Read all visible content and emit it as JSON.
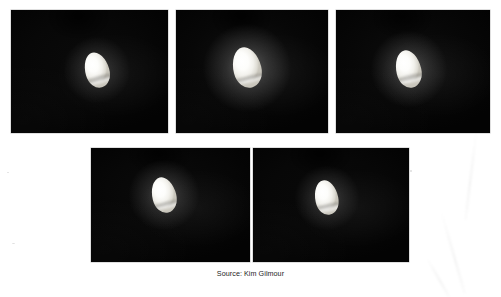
{
  "page": {
    "background_color": "#ffffff",
    "width": 501,
    "height": 295,
    "kind": "scanned-photo-plate"
  },
  "caption": {
    "text": "Source: Kim Gilmour",
    "color": "#1d1d1d",
    "x": 0,
    "y": 269,
    "align": "center"
  },
  "panels": [
    {
      "id": "photo-1",
      "label": "photo-panel-1",
      "row": "top",
      "index": 1,
      "x": 11,
      "y": 10,
      "width": 157,
      "height": 123,
      "background_color": "#050505",
      "sky_tint": "#0a0a0a",
      "object": {
        "name": "bright-ovoid-object",
        "x": 74,
        "y": 42,
        "width": 24,
        "height": 36,
        "rotation": -16,
        "glow_size": 70,
        "glow_opacity": 0.2,
        "fill_color": "#ffffff",
        "band_top_pct": 68,
        "band_height_pct": 12
      }
    },
    {
      "id": "photo-2",
      "label": "photo-panel-2",
      "row": "top",
      "index": 2,
      "x": 176,
      "y": 10,
      "width": 152,
      "height": 123,
      "background_color": "#050505",
      "sky_tint": "#101010",
      "object": {
        "name": "bright-ovoid-object",
        "x": 57,
        "y": 37,
        "width": 28,
        "height": 41,
        "rotation": -14,
        "glow_size": 92,
        "glow_opacity": 0.3,
        "fill_color": "#ffffff",
        "band_top_pct": 70,
        "band_height_pct": 10
      }
    },
    {
      "id": "photo-3",
      "label": "photo-panel-3",
      "row": "top",
      "index": 3,
      "x": 336,
      "y": 10,
      "width": 154,
      "height": 123,
      "background_color": "#050505",
      "sky_tint": "#0d0d0d",
      "object": {
        "name": "bright-ovoid-object",
        "x": 60,
        "y": 40,
        "width": 25,
        "height": 38,
        "rotation": -13,
        "glow_size": 80,
        "glow_opacity": 0.26,
        "fill_color": "#ffffff",
        "band_top_pct": 66,
        "band_height_pct": 12
      }
    },
    {
      "id": "photo-4",
      "label": "photo-panel-4",
      "row": "bottom",
      "index": 4,
      "x": 91,
      "y": 148,
      "width": 159,
      "height": 114,
      "background_color": "#050505",
      "sky_tint": "#0b0b0b",
      "object": {
        "name": "bright-ovoid-object",
        "x": 61,
        "y": 29,
        "width": 24,
        "height": 36,
        "rotation": -14,
        "glow_size": 74,
        "glow_opacity": 0.24,
        "fill_color": "#ffffff",
        "band_top_pct": 70,
        "band_height_pct": 11
      }
    },
    {
      "id": "photo-5",
      "label": "photo-panel-5",
      "row": "bottom",
      "index": 5,
      "x": 253,
      "y": 148,
      "width": 156,
      "height": 114,
      "background_color": "#050505",
      "sky_tint": "#090909",
      "object": {
        "name": "bright-ovoid-object",
        "x": 62,
        "y": 32,
        "width": 23,
        "height": 35,
        "rotation": -12,
        "glow_size": 68,
        "glow_opacity": 0.22,
        "fill_color": "#ffffff",
        "band_top_pct": 69,
        "band_height_pct": 12
      }
    }
  ]
}
